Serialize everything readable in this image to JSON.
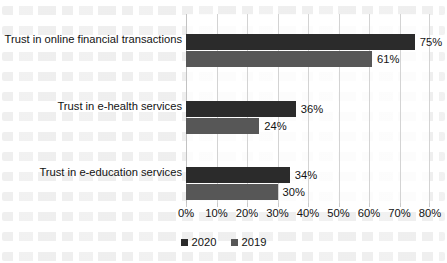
{
  "chart_data": {
    "type": "bar",
    "orientation": "horizontal",
    "title": "",
    "xlabel": "",
    "ylabel": "",
    "xlim": [
      0,
      80
    ],
    "xtick_labels": [
      "0%",
      "10%",
      "20%",
      "30%",
      "40%",
      "50%",
      "60%",
      "70%",
      "80%"
    ],
    "xtick_values": [
      0,
      10,
      20,
      30,
      40,
      50,
      60,
      70,
      80
    ],
    "grid": true,
    "legend_position": "bottom-center",
    "categories": [
      "Trust in online financial transactions",
      "Trust in e-health services",
      "Trust in e-education services"
    ],
    "series": [
      {
        "name": "2020",
        "color": "#2b2b2b",
        "values": [
          75,
          36,
          34
        ],
        "labels": [
          "75%",
          "36%",
          "34%"
        ]
      },
      {
        "name": "2019",
        "color": "#575757",
        "values": [
          61,
          24,
          30
        ],
        "labels": [
          "61%",
          "24%",
          "30%"
        ]
      }
    ]
  },
  "legend": {
    "items": [
      {
        "label": "2020",
        "color": "#2b2b2b"
      },
      {
        "label": "2019",
        "color": "#575757"
      }
    ]
  }
}
